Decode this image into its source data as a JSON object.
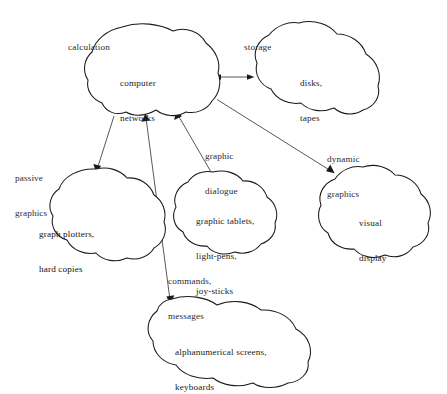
{
  "diagram": {
    "background_color": "#ffffff",
    "outline_color": "#1a1a1a",
    "edge_color": "#3a3a3a",
    "text_color": "#1b1b22",
    "nodes": [
      {
        "id": "computer-networks",
        "label": "computer\nnetworks",
        "line1": "computer",
        "line2": "networks"
      },
      {
        "id": "disks-tapes",
        "label": "disks,\ntapes",
        "line1": "disks,",
        "line2": "tapes"
      },
      {
        "id": "graph-plotters",
        "label": "graph plotters,\nhard copies",
        "line1": "graph plotters,",
        "line2": "hard copies"
      },
      {
        "id": "graphic-tablets",
        "label": "graphic tablets,\nlight-pens,\njoy-sticks",
        "line1": "graphic tablets,",
        "line2": "light-pens,",
        "line3": "joy-sticks"
      },
      {
        "id": "visual-display",
        "label": "visual\ndisplay",
        "line1": "visual",
        "line2": "display"
      },
      {
        "id": "alphanumerical-screens",
        "label": "alphanumerical screens,\nkeyboards",
        "line1": "alphanumerical screens,",
        "line2": "keyboards"
      }
    ],
    "edge_labels": [
      {
        "id": "calculation",
        "line1": "calculation"
      },
      {
        "id": "storage",
        "line1": "storage"
      },
      {
        "id": "passive-graphics",
        "line1": "passive",
        "line2": "graphics"
      },
      {
        "id": "graphic-dialogue",
        "line1": "graphic",
        "line2": "dialogue"
      },
      {
        "id": "dynamic-graphics",
        "line1": "dynamic",
        "line2": "graphics"
      },
      {
        "id": "commands-messages",
        "line1": "commands,",
        "line2": "messages"
      }
    ],
    "edges": [
      {
        "id": "networks-to-disks",
        "from": "computer-networks",
        "to": "disks-tapes",
        "label": "storage",
        "direction": "bidirectional"
      },
      {
        "id": "networks-to-plotters",
        "from": "computer-networks",
        "to": "graph-plotters",
        "label": "passive graphics",
        "direction": "forward"
      },
      {
        "id": "alphanumerical-to-networks",
        "from": "alphanumerical-screens",
        "to": "computer-networks",
        "label": "commands, messages",
        "direction": "bidirectional"
      },
      {
        "id": "tablets-to-networks",
        "from": "graphic-tablets",
        "to": "computer-networks",
        "label": "graphic dialogue",
        "direction": "forward"
      },
      {
        "id": "networks-to-display",
        "from": "computer-networks",
        "to": "visual-display",
        "label": "dynamic graphics",
        "direction": "forward"
      }
    ]
  }
}
